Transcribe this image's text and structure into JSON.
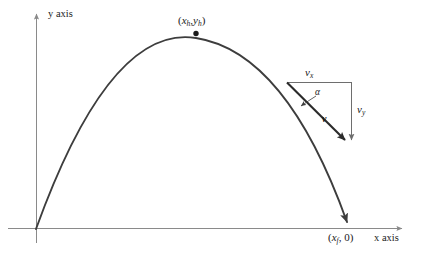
{
  "figure": {
    "axes": {
      "y_label": "y axis",
      "x_label": "x axis",
      "axis_color": "#8a8a8a"
    },
    "curve": {
      "color": "#3d3d3d",
      "vertex_dot": true
    },
    "labels": {
      "vertex_open_paren": "(",
      "vertex_x_var": "x",
      "vertex_x_sub": "h",
      "vertex_comma": ",",
      "vertex_y_var": "y",
      "vertex_y_sub": "h",
      "vertex_close_paren": ")",
      "landing_open_paren": "(",
      "landing_x_var": "x",
      "landing_x_sub": "f",
      "landing_rest": ", 0)",
      "vx_var": "v",
      "vx_sub": "x",
      "vy_var": "v",
      "vy_sub": "y",
      "velocity_vector": "v",
      "angle": "α"
    },
    "colors": {
      "background": "#ffffff",
      "curve": "#3d3d3d",
      "axis": "#8a8a8a",
      "triangle_side": "#6e6e6e",
      "vector": "#2b2b2b",
      "text": "#1a1a1a"
    }
  }
}
